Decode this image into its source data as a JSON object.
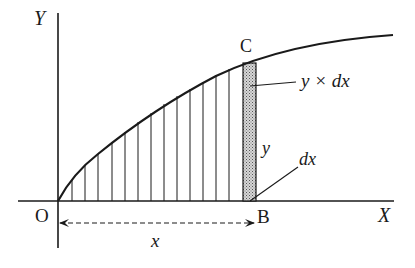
{
  "diagram": {
    "axes": {
      "y_label": "Y",
      "x_label": "X",
      "origin_label": "O"
    },
    "points": {
      "C": "C",
      "B": "B"
    },
    "annotations": {
      "strip_area": "y × dx",
      "strip_height": "y",
      "strip_width": "dx",
      "distance": "x"
    },
    "colors": {
      "ink": "#1a1a1a",
      "strip_fill": "#b8b8b8",
      "background": "#ffffff"
    },
    "hatch_lines_count": 13
  }
}
